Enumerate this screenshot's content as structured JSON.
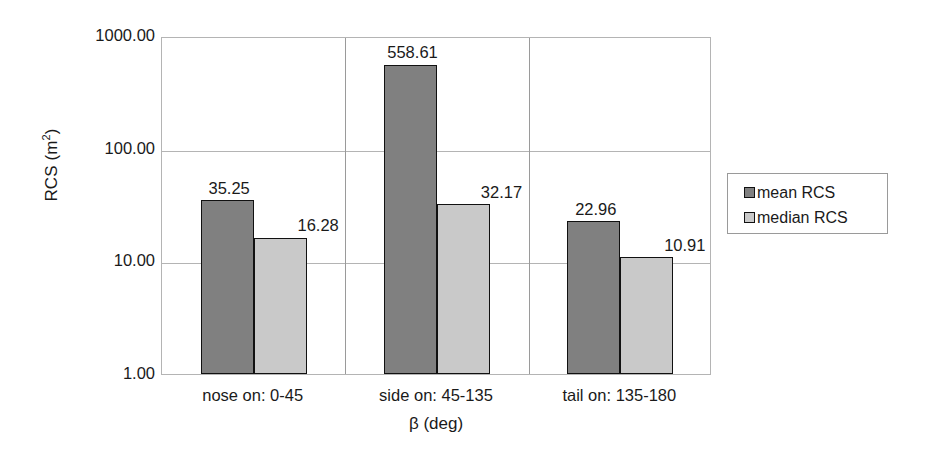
{
  "chart_data": {
    "type": "bar",
    "title": "",
    "subtitle": "",
    "xlabel": "β (deg)",
    "ylabel": "RCS (m²)",
    "ylabel_base": "RCS (m",
    "ylabel_exponent": "2",
    "ylabel_close": ")",
    "categories": [
      "nose on:  0-45",
      "side on: 45-135",
      "tail on: 135-180"
    ],
    "series": [
      {
        "name": "mean RCS",
        "values": [
          35.25,
          558.61,
          22.96
        ],
        "color": "#808080"
      },
      {
        "name": "median RCS",
        "values": [
          16.28,
          32.17,
          10.91
        ],
        "color": "#c9c9c9"
      }
    ],
    "value_labels": {
      "mean": [
        "35.25",
        "558.61",
        "22.96"
      ],
      "median": [
        "16.28",
        "32.17",
        "10.91"
      ]
    },
    "yscale": "log",
    "ylim": [
      1,
      1000
    ],
    "ytick_labels": [
      "1000.00",
      "100.00",
      "10.00",
      "1.00"
    ],
    "ytick_values": [
      1000,
      100,
      10,
      1
    ],
    "grid": true,
    "grid_horizontal": true,
    "grid_vertical": true,
    "legend_position": "right",
    "legend_entries": [
      "mean RCS",
      "median RCS"
    ],
    "background_color": "#ffffff",
    "axis_color": "#b4b4b4",
    "bar_border_color": "#111111"
  }
}
